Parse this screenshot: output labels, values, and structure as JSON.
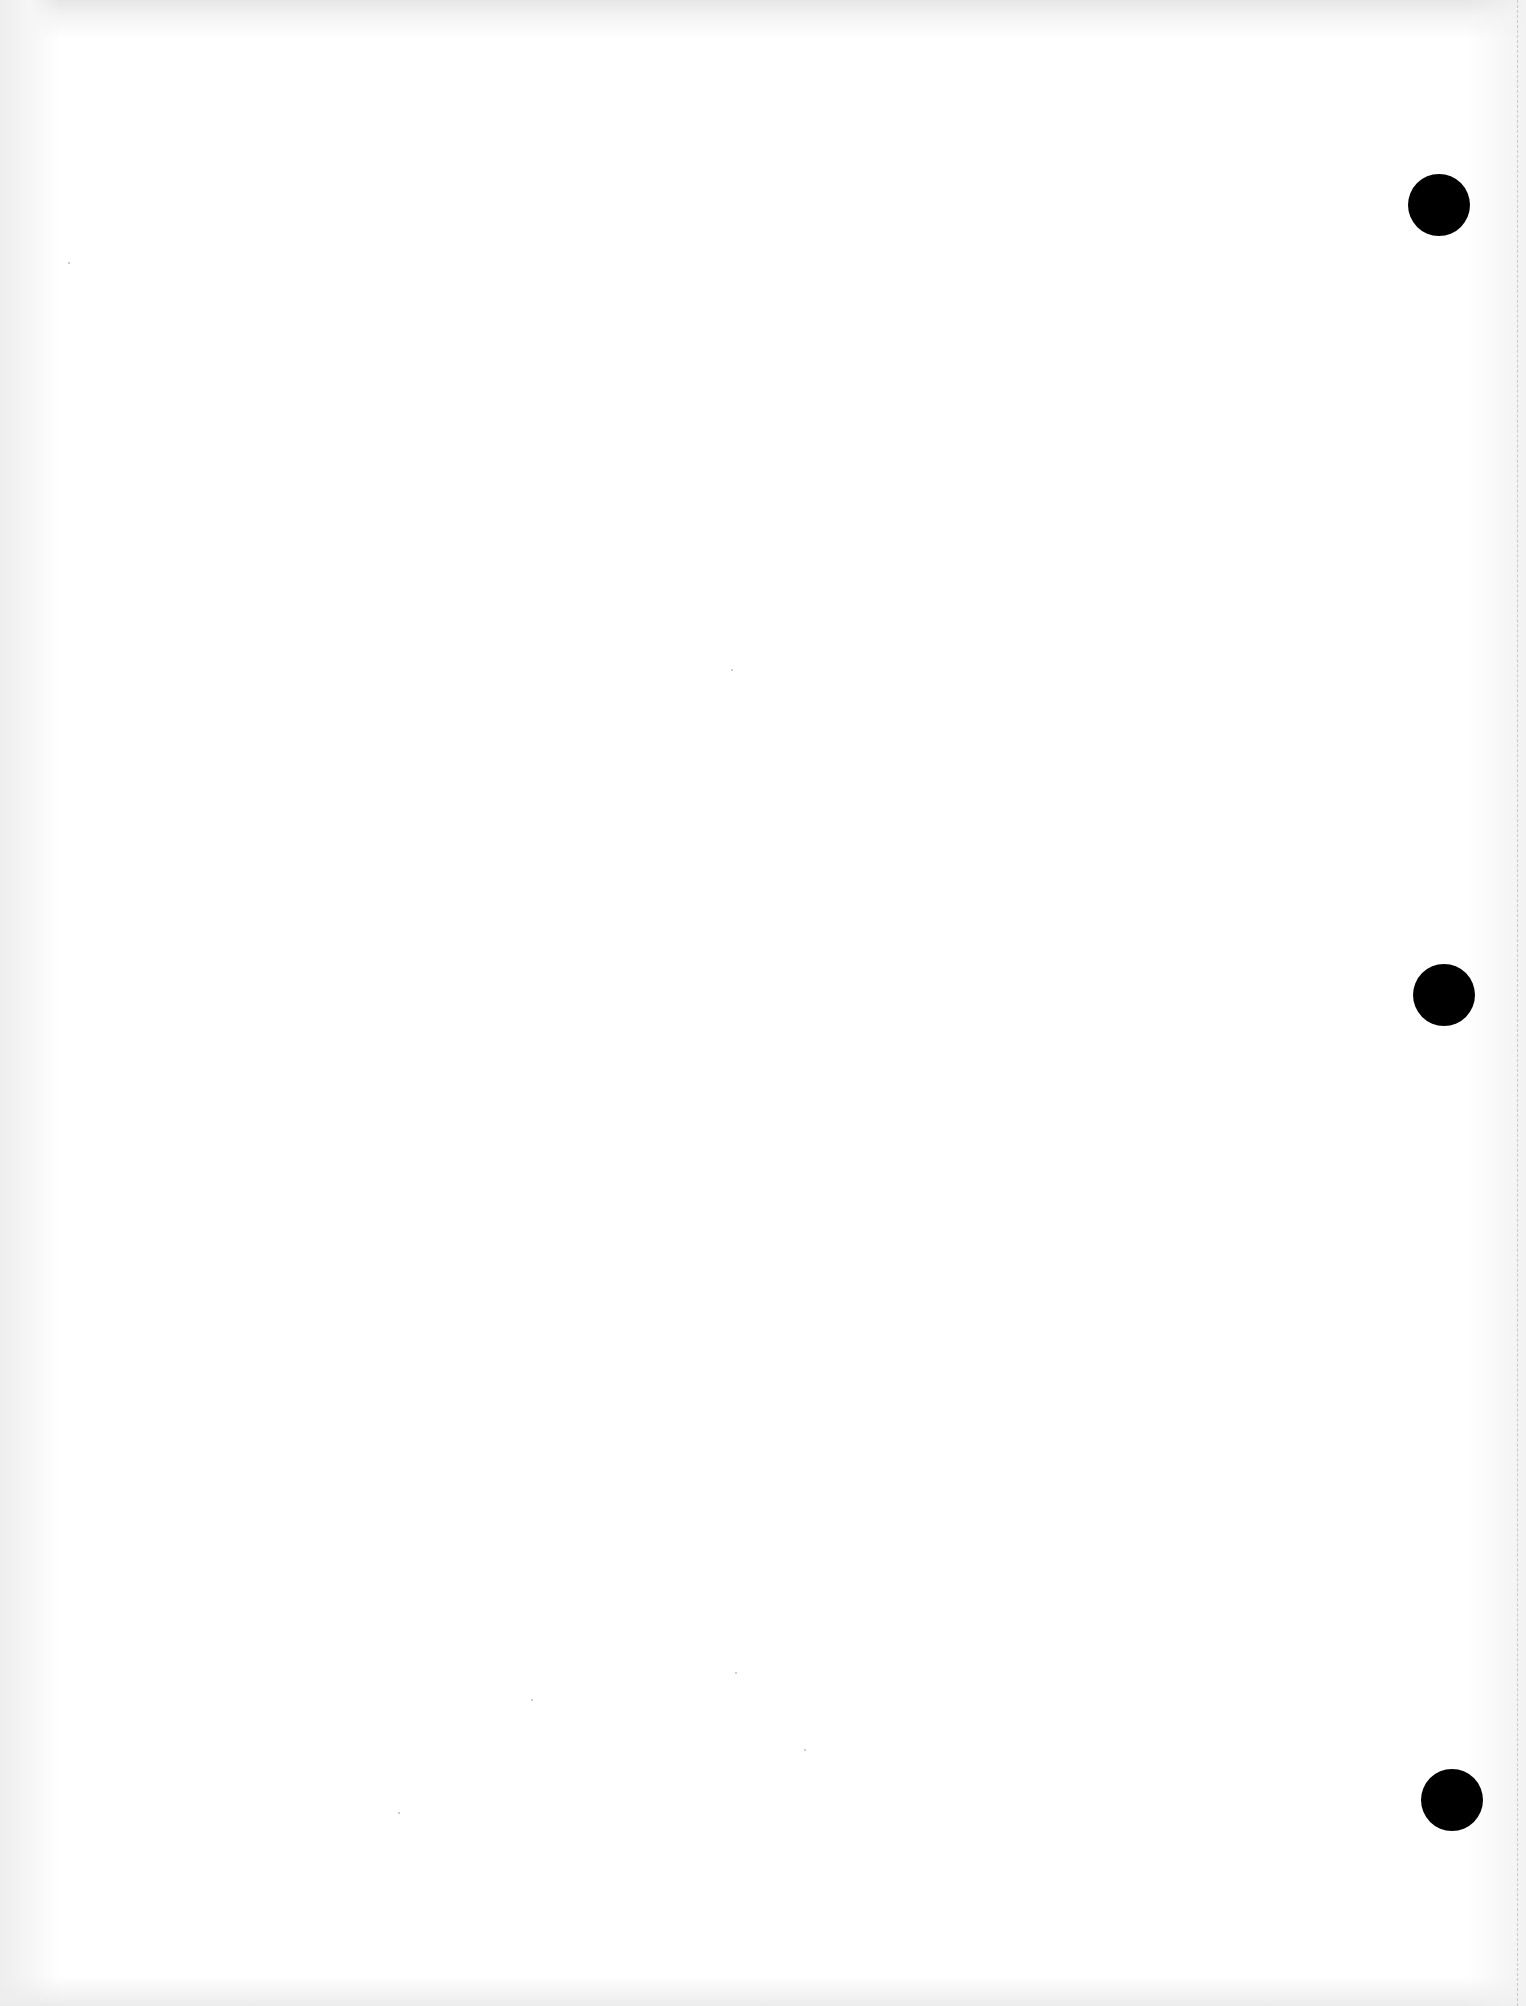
{
  "document": {
    "type": "blank-punched-page",
    "text": "",
    "colors": {
      "paper": "#ffffff",
      "hole": "#000000",
      "edge_shade": "#e6e6e6",
      "perforation": "#c9c9c9"
    },
    "punch_holes": [
      {
        "cx": 1439,
        "cy": 205,
        "r": 31
      },
      {
        "cx": 1444,
        "cy": 995,
        "r": 31
      },
      {
        "cx": 1452,
        "cy": 1800,
        "r": 31
      }
    ]
  }
}
